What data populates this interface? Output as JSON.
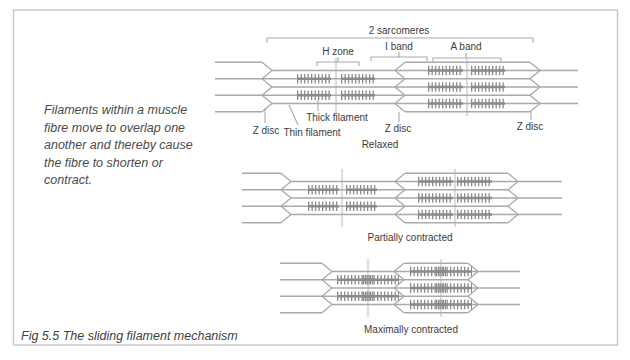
{
  "figure": {
    "caption": "Fig 5.5 The sliding filament mechanism",
    "intro_text": "Filaments within a muscle fibre move to overlap one another and thereby cause the fibre to shorten or contract."
  },
  "labels": {
    "two_sarcomeres": "2 sarcomeres",
    "h_zone": "H zone",
    "i_band": "I band",
    "a_band": "A band",
    "z_disc": "Z disc",
    "thick_filament": "Thick filament",
    "thin_filament": "Thin filament",
    "relaxed": "Relaxed",
    "partially_contracted": "Partially contracted",
    "maximally_contracted": "Maximally contracted"
  },
  "colors": {
    "outline": "#a9a9ad",
    "filament": "#8a8a8a",
    "m_line": "#dddddf",
    "text": "#3c3c3c",
    "border": "#c7c7cb",
    "intro_text": "#4a4a4a"
  }
}
